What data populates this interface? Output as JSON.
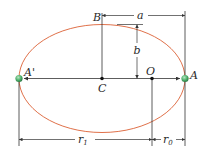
{
  "diagram": {
    "type": "elliptical-orbit",
    "colors": {
      "ellipse": "#e0714a",
      "lines": "#333333",
      "planet": "#4caf6a",
      "point": "#111111"
    },
    "labels": {
      "apoapsis": "A'",
      "periapsis": "A",
      "center": "C",
      "focus": "O",
      "minor_vertex": "B",
      "semi_major": "a",
      "semi_minor": "b",
      "r1_base": "r",
      "r1_sub": "1",
      "r0_base": "r",
      "r0_sub": "0"
    }
  }
}
